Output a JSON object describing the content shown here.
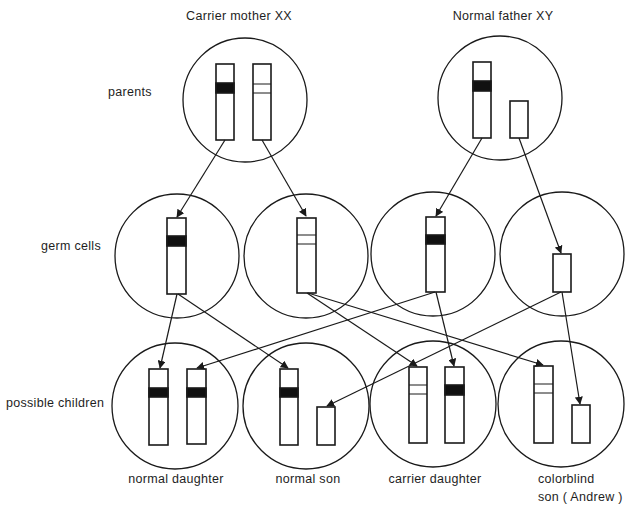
{
  "headers": {
    "mother": "Carrier mother XX",
    "father": "Normal father XY"
  },
  "row_labels": {
    "parents": "parents",
    "germ_cells": "germ cells",
    "children": "possible children"
  },
  "children_captions": {
    "normal_daughter": "normal daughter",
    "normal_son": "normal son",
    "carrier_daughter": "carrier daughter",
    "colorblind_son_line1": "colorblind",
    "colorblind_son_line2": "son ( Andrew )"
  },
  "legend_semantics": {
    "solid_band": "normal allele (dark band)",
    "striped_band": "colorblind allele (outlined band)",
    "short_rect": "Y chromosome"
  },
  "colors": {
    "stroke": "#1a1a1a",
    "background": "#ffffff"
  }
}
